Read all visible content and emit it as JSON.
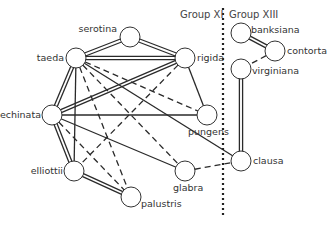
{
  "groups": [
    {
      "label": "Group XI",
      "x": 180,
      "y": 18
    },
    {
      "label": "Group XIII",
      "x": 229,
      "y": 18
    }
  ],
  "separator": {
    "x": 223,
    "y1": 8,
    "y2": 218
  },
  "node_radius": 10,
  "nodes": [
    {
      "id": "serotina",
      "label": "serotina",
      "x": 130,
      "y": 37,
      "lx": 117,
      "ly": 32,
      "anchor": "end"
    },
    {
      "id": "taeda",
      "label": "taeda",
      "x": 76,
      "y": 58,
      "lx": 64,
      "ly": 61,
      "anchor": "end"
    },
    {
      "id": "rigida",
      "label": "rigida",
      "x": 185,
      "y": 58,
      "lx": 197,
      "ly": 61,
      "anchor": "start"
    },
    {
      "id": "echinata",
      "label": "echinata",
      "x": 52,
      "y": 115,
      "lx": 41,
      "ly": 118,
      "anchor": "end"
    },
    {
      "id": "pungens",
      "label": "pungens",
      "x": 207,
      "y": 115,
      "lx": 188,
      "ly": 135,
      "anchor": "start"
    },
    {
      "id": "elliottii",
      "label": "elliottii",
      "x": 74,
      "y": 171,
      "lx": 63,
      "ly": 174,
      "anchor": "end"
    },
    {
      "id": "glabra",
      "label": "glabra",
      "x": 185,
      "y": 171,
      "lx": 173,
      "ly": 191,
      "anchor": "start"
    },
    {
      "id": "palustris",
      "label": "palustris",
      "x": 131,
      "y": 197,
      "lx": 141,
      "ly": 207,
      "anchor": "start"
    },
    {
      "id": "banksiana",
      "label": "banksiana",
      "x": 241,
      "y": 33,
      "lx": 251,
      "ly": 33,
      "anchor": "start"
    },
    {
      "id": "contorta",
      "label": "contorta",
      "x": 275,
      "y": 51,
      "lx": 287,
      "ly": 54,
      "anchor": "start"
    },
    {
      "id": "virginiana",
      "label": "virginiana",
      "x": 241,
      "y": 69,
      "lx": 252,
      "ly": 74,
      "anchor": "start"
    },
    {
      "id": "clausa",
      "label": "clausa",
      "x": 241,
      "y": 161,
      "lx": 253,
      "ly": 164,
      "anchor": "start"
    }
  ],
  "edges": [
    {
      "from": "taeda",
      "to": "serotina",
      "style": "double"
    },
    {
      "from": "serotina",
      "to": "rigida",
      "style": "double"
    },
    {
      "from": "taeda",
      "to": "rigida",
      "style": "double"
    },
    {
      "from": "taeda",
      "to": "echinata",
      "style": "double"
    },
    {
      "from": "rigida",
      "to": "echinata",
      "style": "double"
    },
    {
      "from": "echinata",
      "to": "elliottii",
      "style": "double"
    },
    {
      "from": "elliottii",
      "to": "palustris",
      "style": "double"
    },
    {
      "from": "banksiana",
      "to": "contorta",
      "style": "double"
    },
    {
      "from": "virginiana",
      "to": "clausa",
      "style": "double"
    },
    {
      "from": "taeda",
      "to": "elliottii",
      "style": "solid"
    },
    {
      "from": "taeda",
      "to": "clausa",
      "style": "solid"
    },
    {
      "from": "rigida",
      "to": "pungens",
      "style": "solid"
    },
    {
      "from": "echinata",
      "to": "pungens",
      "style": "solid"
    },
    {
      "from": "echinata",
      "to": "glabra",
      "style": "solid"
    },
    {
      "from": "taeda",
      "to": "pungens",
      "style": "dashed"
    },
    {
      "from": "taeda",
      "to": "glabra",
      "style": "dashed"
    },
    {
      "from": "taeda",
      "to": "palustris",
      "style": "dashed"
    },
    {
      "from": "echinata",
      "to": "palustris",
      "style": "dashed"
    },
    {
      "from": "rigida",
      "to": "elliottii",
      "style": "dashed"
    },
    {
      "from": "glabra",
      "to": "clausa",
      "style": "dashed"
    },
    {
      "from": "contorta",
      "to": "virginiana",
      "style": "dashed"
    }
  ],
  "colors": {
    "line": "#2a2a2a",
    "node_fill": "#ffffff",
    "node_stroke": "#333333",
    "separator": "#222222"
  }
}
